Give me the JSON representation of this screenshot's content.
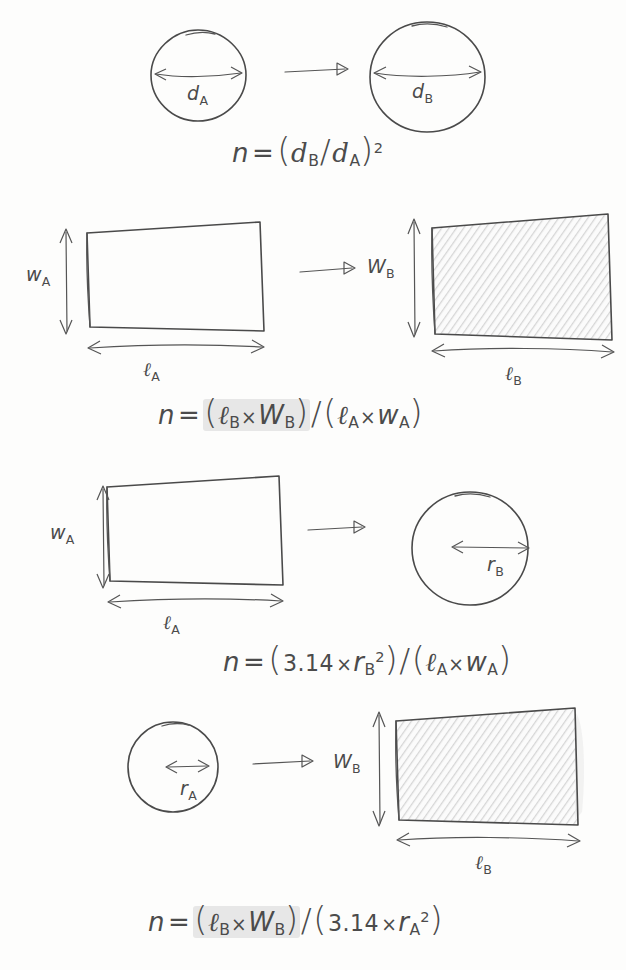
{
  "background_color": "#fdfdfc",
  "ink_color": "#4a4a4a",
  "hatch_color": "#d8d8d8",
  "highlight_color": "#aaaaaa",
  "rows": [
    {
      "id": "row-circle-to-circle",
      "left_shape": {
        "kind": "circle",
        "fill": "white",
        "dimension_label": "d",
        "dimension_sub": "A",
        "dimension_kind": "diameter"
      },
      "right_shape": {
        "kind": "circle",
        "fill": "white",
        "dimension_label": "d",
        "dimension_sub": "B",
        "dimension_kind": "diameter"
      },
      "arrow": "right-arrow",
      "formula": {
        "lhs": "n",
        "eq": "=",
        "text": "n = (d_B / d_A)^2",
        "parts": [
          {
            "t": "paren",
            "v": "("
          },
          {
            "t": "var",
            "v": "d",
            "sub": "B"
          },
          {
            "t": "slash",
            "v": "/"
          },
          {
            "t": "var",
            "v": "d",
            "sub": "A"
          },
          {
            "t": "paren",
            "v": ")"
          },
          {
            "t": "sup",
            "v": "2"
          }
        ],
        "highlight": false
      }
    },
    {
      "id": "row-rect-to-rect",
      "left_shape": {
        "kind": "rect",
        "fill": "white",
        "width_label": "w",
        "width_sub": "A",
        "length_label": "ℓ",
        "length_sub": "A"
      },
      "right_shape": {
        "kind": "rect",
        "fill": "hatched",
        "width_label": "W",
        "width_sub": "B",
        "length_label": "ℓ",
        "length_sub": "B"
      },
      "arrow": "right-arrow",
      "formula": {
        "lhs": "n",
        "eq": "=",
        "text": "n = (ℓ_B × W_B) / (ℓ_A × W_A)",
        "highlight": true
      }
    },
    {
      "id": "row-rect-to-circle",
      "left_shape": {
        "kind": "rect",
        "fill": "white",
        "width_label": "w",
        "width_sub": "A",
        "length_label": "ℓ",
        "length_sub": "A"
      },
      "right_shape": {
        "kind": "circle",
        "fill": "white",
        "dimension_label": "r",
        "dimension_sub": "B",
        "dimension_kind": "radius"
      },
      "arrow": "right-arrow",
      "formula": {
        "lhs": "n",
        "eq": "=",
        "text": "n = (3.14 × r_B^2) / (ℓ_A × W_A)",
        "constant": "3.14",
        "highlight": false
      }
    },
    {
      "id": "row-circle-to-rect",
      "left_shape": {
        "kind": "circle",
        "fill": "white",
        "dimension_label": "r",
        "dimension_sub": "A",
        "dimension_kind": "radius"
      },
      "right_shape": {
        "kind": "rect",
        "fill": "hatched",
        "width_label": "W",
        "width_sub": "B",
        "length_label": "ℓ",
        "length_sub": "B"
      },
      "arrow": "right-arrow",
      "formula": {
        "lhs": "n",
        "eq": "=",
        "text": "n = (ℓ_B × W_B) / (3.14 × r_A^2)",
        "constant": "3.14",
        "highlight": true
      }
    }
  ],
  "labels": {
    "n": "n",
    "equals": "=",
    "times": "×",
    "divide": "/",
    "open_paren": "(",
    "close_paren": ")",
    "square": "2",
    "pi_value": "3.14",
    "d_A": "d",
    "d_A_sub": "A",
    "d_B": "d",
    "d_B_sub": "B",
    "r_A": "r",
    "r_A_sub": "A",
    "r_B": "r",
    "r_B_sub": "B",
    "w_A": "w",
    "w_A_sub": "A",
    "W_B": "W",
    "W_B_sub": "B",
    "l_A": "ℓ",
    "l_A_sub": "A",
    "l_B": "ℓ",
    "l_B_sub": "B"
  }
}
